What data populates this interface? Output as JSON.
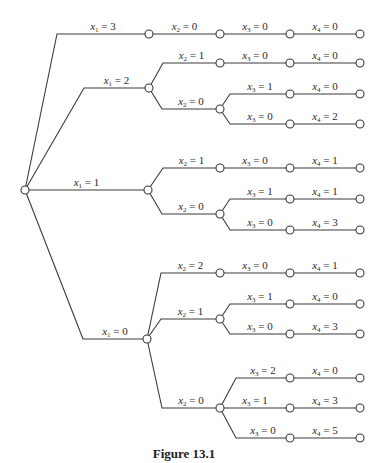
{
  "figure": {
    "caption": "Figure 13.1",
    "type": "decision-tree",
    "colors": {
      "line": "#3a3a3a",
      "node_fill": "#ffffff",
      "text": "#2a2a2a"
    }
  },
  "tree": {
    "root": {
      "x": 25,
      "y": 190
    },
    "nodes": [
      {
        "id": "a",
        "x": 149,
        "y": 34,
        "parent": "root",
        "var": "x",
        "sub": "1",
        "value": "3",
        "knee": 57
      },
      {
        "id": "a1",
        "x": 220,
        "y": 34,
        "parent": "a",
        "var": "x",
        "sub": "2",
        "value": "0",
        "knee": 149
      },
      {
        "id": "a2",
        "x": 290,
        "y": 34,
        "parent": "a1",
        "var": "x",
        "sub": "3",
        "value": "0",
        "knee": 220
      },
      {
        "id": "a3",
        "x": 360,
        "y": 34,
        "parent": "a2",
        "var": "x",
        "sub": "4",
        "value": "0",
        "knee": 290
      },
      {
        "id": "b",
        "x": 149,
        "y": 88,
        "parent": "root",
        "var": "x",
        "sub": "1",
        "value": "2",
        "knee": 84
      },
      {
        "id": "b1",
        "x": 220,
        "y": 63,
        "parent": "b",
        "var": "x",
        "sub": "2",
        "value": "1",
        "knee": 163
      },
      {
        "id": "b1a",
        "x": 290,
        "y": 63,
        "parent": "b1",
        "var": "x",
        "sub": "3",
        "value": "0",
        "knee": 220
      },
      {
        "id": "b1b",
        "x": 360,
        "y": 63,
        "parent": "b1a",
        "var": "x",
        "sub": "4",
        "value": "0",
        "knee": 290
      },
      {
        "id": "b2",
        "x": 220,
        "y": 109,
        "parent": "b",
        "var": "x",
        "sub": "2",
        "value": "0",
        "knee": 162
      },
      {
        "id": "b2a",
        "x": 290,
        "y": 94,
        "parent": "b2",
        "var": "x",
        "sub": "3",
        "value": "1",
        "knee": 230
      },
      {
        "id": "b2b",
        "x": 360,
        "y": 94,
        "parent": "b2a",
        "var": "x",
        "sub": "4",
        "value": "0",
        "knee": 290
      },
      {
        "id": "b2c",
        "x": 290,
        "y": 124,
        "parent": "b2",
        "var": "x",
        "sub": "3",
        "value": "0",
        "knee": 230
      },
      {
        "id": "b2d",
        "x": 360,
        "y": 124,
        "parent": "b2c",
        "var": "x",
        "sub": "4",
        "value": "2",
        "knee": 290
      },
      {
        "id": "c",
        "x": 148,
        "y": 190,
        "parent": "root",
        "var": "x",
        "sub": "1",
        "value": "1",
        "knee": 25
      },
      {
        "id": "c1",
        "x": 220,
        "y": 168,
        "parent": "c",
        "var": "x",
        "sub": "2",
        "value": "1",
        "knee": 163
      },
      {
        "id": "c1a",
        "x": 290,
        "y": 168,
        "parent": "c1",
        "var": "x",
        "sub": "3",
        "value": "0",
        "knee": 220
      },
      {
        "id": "c1b",
        "x": 360,
        "y": 168,
        "parent": "c1a",
        "var": "x",
        "sub": "4",
        "value": "1",
        "knee": 290
      },
      {
        "id": "c2",
        "x": 220,
        "y": 214,
        "parent": "c",
        "var": "x",
        "sub": "2",
        "value": "0",
        "knee": 162
      },
      {
        "id": "c2a",
        "x": 290,
        "y": 199,
        "parent": "c2",
        "var": "x",
        "sub": "3",
        "value": "1",
        "knee": 230
      },
      {
        "id": "c2b",
        "x": 360,
        "y": 199,
        "parent": "c2a",
        "var": "x",
        "sub": "4",
        "value": "1",
        "knee": 290
      },
      {
        "id": "c2c",
        "x": 290,
        "y": 230,
        "parent": "c2",
        "var": "x",
        "sub": "3",
        "value": "0",
        "knee": 230
      },
      {
        "id": "c2d",
        "x": 360,
        "y": 230,
        "parent": "c2c",
        "var": "x",
        "sub": "4",
        "value": "3",
        "knee": 290
      },
      {
        "id": "d",
        "x": 147,
        "y": 339,
        "parent": "root",
        "var": "x",
        "sub": "1",
        "value": "0",
        "knee": 83
      },
      {
        "id": "d1",
        "x": 220,
        "y": 273,
        "parent": "d",
        "var": "x",
        "sub": "2",
        "value": "2",
        "knee": 161
      },
      {
        "id": "d1a",
        "x": 290,
        "y": 273,
        "parent": "d1",
        "var": "x",
        "sub": "3",
        "value": "0",
        "knee": 220
      },
      {
        "id": "d1b",
        "x": 360,
        "y": 273,
        "parent": "d1a",
        "var": "x",
        "sub": "4",
        "value": "1",
        "knee": 290
      },
      {
        "id": "d2",
        "x": 220,
        "y": 319,
        "parent": "d",
        "var": "x",
        "sub": "2",
        "value": "1",
        "knee": 161
      },
      {
        "id": "d2a",
        "x": 290,
        "y": 304,
        "parent": "d2",
        "var": "x",
        "sub": "3",
        "value": "1",
        "knee": 230
      },
      {
        "id": "d2b",
        "x": 360,
        "y": 304,
        "parent": "d2a",
        "var": "x",
        "sub": "4",
        "value": "0",
        "knee": 290
      },
      {
        "id": "d2c",
        "x": 290,
        "y": 334,
        "parent": "d2",
        "var": "x",
        "sub": "3",
        "value": "0",
        "knee": 230
      },
      {
        "id": "d2d",
        "x": 360,
        "y": 334,
        "parent": "d2c",
        "var": "x",
        "sub": "4",
        "value": "3",
        "knee": 290
      },
      {
        "id": "d3",
        "x": 220,
        "y": 408,
        "parent": "d",
        "var": "x",
        "sub": "2",
        "value": "0",
        "knee": 162
      },
      {
        "id": "d3a",
        "x": 290,
        "y": 378,
        "parent": "d3",
        "var": "x",
        "sub": "3",
        "value": "2",
        "knee": 236
      },
      {
        "id": "d3b",
        "x": 360,
        "y": 378,
        "parent": "d3a",
        "var": "x",
        "sub": "4",
        "value": "0",
        "knee": 290
      },
      {
        "id": "d3c",
        "x": 290,
        "y": 408,
        "parent": "d3",
        "var": "x",
        "sub": "3",
        "value": "1",
        "knee": 220
      },
      {
        "id": "d3d",
        "x": 360,
        "y": 408,
        "parent": "d3c",
        "var": "x",
        "sub": "4",
        "value": "3",
        "knee": 290
      },
      {
        "id": "d3e",
        "x": 290,
        "y": 438,
        "parent": "d3",
        "var": "x",
        "sub": "3",
        "value": "0",
        "knee": 236
      },
      {
        "id": "d3f",
        "x": 360,
        "y": 438,
        "parent": "d3e",
        "var": "x",
        "sub": "4",
        "value": "5",
        "knee": 290
      }
    ]
  }
}
